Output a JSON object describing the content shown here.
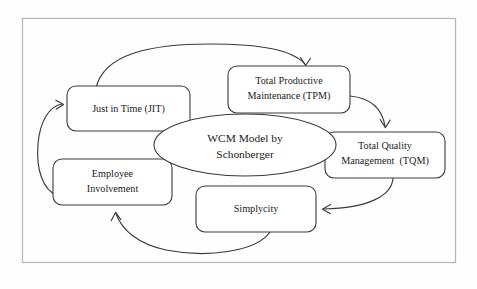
{
  "diagram": {
    "title": "WCM Model by Schonberger",
    "type": "cycle-diagram",
    "frame": {
      "visible": true,
      "color": "#b9b9b9"
    },
    "center_node": {
      "name": "wcm-model-center",
      "shape": "ellipse",
      "line1": "WCM Model by",
      "line2": "Schonberger"
    },
    "nodes": [
      {
        "name": "just-in-time",
        "shape": "rounded-rect",
        "line1": "Just in Time (JIT)",
        "line2": ""
      },
      {
        "name": "total-productive-maintenance",
        "shape": "rounded-rect",
        "line1": "Total Productive",
        "line2": "Maintenance (TPM)"
      },
      {
        "name": "total-quality-management",
        "shape": "rounded-rect",
        "line1": "Total Quality",
        "line2": "Management  (TQM)"
      },
      {
        "name": "simplycity",
        "shape": "rounded-rect",
        "line1": "Simplycity",
        "line2": ""
      },
      {
        "name": "employee-involvement",
        "shape": "rounded-rect",
        "line1": "Employee",
        "line2": "Involvement"
      }
    ],
    "connections": [
      {
        "name": "arrow-jit-to-tpm",
        "from": "just-in-time",
        "to": "total-productive-maintenance"
      },
      {
        "name": "arrow-tpm-to-tqm",
        "from": "total-productive-maintenance",
        "to": "total-quality-management"
      },
      {
        "name": "arrow-tqm-to-simplycity",
        "from": "total-quality-management",
        "to": "simplycity"
      },
      {
        "name": "arrow-simplycity-to-employee",
        "from": "simplycity",
        "to": "employee-involvement"
      },
      {
        "name": "arrow-employee-to-jit",
        "from": "employee-involvement",
        "to": "just-in-time"
      }
    ],
    "colors": {
      "stroke": "#3a3a3a",
      "fill": "#ffffff",
      "frame": "#b9b9b9",
      "text": "#1a1a1a"
    }
  }
}
